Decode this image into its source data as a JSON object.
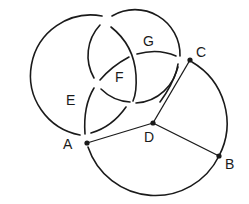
{
  "diagram": {
    "labels": {
      "A": "A",
      "B": "B",
      "C": "C",
      "D": "D",
      "E": "E",
      "F": "F",
      "G": "G"
    },
    "points": {
      "A": [
        87,
        143
      ],
      "B": [
        219,
        156
      ],
      "C": [
        190,
        60
      ],
      "D": [
        153,
        123
      ]
    },
    "segments": [
      [
        "D",
        "A"
      ],
      [
        "D",
        "B"
      ],
      [
        "D",
        "C"
      ]
    ],
    "colors": {
      "stroke": "#1a1a1a",
      "background": "#ffffff"
    }
  }
}
